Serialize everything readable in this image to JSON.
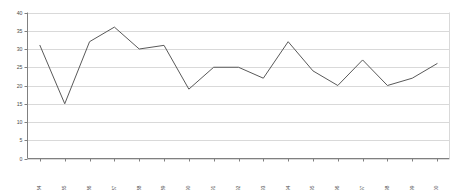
{
  "chart_data": {
    "type": "line",
    "title": "",
    "subtitle": "",
    "xlabel": "",
    "ylabel": "",
    "categories": [
      "1984",
      "1985",
      "1986",
      "1987",
      "1988",
      "1989",
      "1990",
      "1991",
      "1992",
      "1993",
      "1994",
      "1995",
      "1996",
      "1997",
      "1998",
      "1999",
      "2000"
    ],
    "values": [
      31,
      15,
      32,
      36,
      30,
      31,
      19,
      25,
      25,
      22,
      32,
      24,
      20,
      27,
      20,
      22,
      26
    ],
    "series": [
      {
        "name": "",
        "values": [
          31,
          15,
          32,
          36,
          30,
          31,
          19,
          25,
          25,
          22,
          32,
          24,
          20,
          27,
          20,
          22,
          26
        ]
      }
    ],
    "ylim": [
      0,
      40
    ],
    "yticks": [
      0,
      5,
      10,
      15,
      20,
      25,
      30,
      35,
      40
    ],
    "ytick_labels": [
      "0",
      "5",
      "10",
      "15",
      "20",
      "25",
      "30",
      "35",
      "40"
    ],
    "grid": true,
    "grid_axis": "y",
    "legend": false,
    "legend_position": "none",
    "line_color": "#595959",
    "grid_color": "#d9d9d9",
    "axis_color": "#808080",
    "background_color": "#ffffff",
    "markers": false,
    "xtick_rotation": 90
  }
}
